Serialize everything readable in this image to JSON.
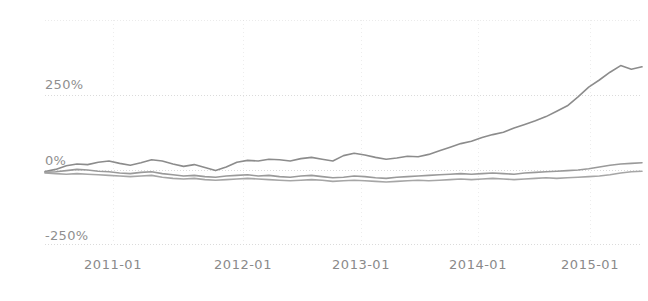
{
  "chart_data": {
    "type": "line",
    "title": "",
    "xlabel": "",
    "ylabel": "",
    "grid": true,
    "legend_position": "none",
    "ylim": [
      -250,
      400
    ],
    "yticks": [
      250,
      0,
      -250
    ],
    "ytick_labels": [
      "250%",
      "0%",
      "-250%"
    ],
    "x": [
      "2010-09",
      "2010-10",
      "2010-11",
      "2010-12",
      "2011-01",
      "2011-02",
      "2011-03",
      "2011-04",
      "2011-05",
      "2011-06",
      "2011-07",
      "2011-08",
      "2011-09",
      "2011-10",
      "2011-11",
      "2011-12",
      "2012-01",
      "2012-02",
      "2012-03",
      "2012-04",
      "2012-05",
      "2012-06",
      "2012-07",
      "2012-08",
      "2012-09",
      "2012-10",
      "2012-11",
      "2012-12",
      "2013-01",
      "2013-02",
      "2013-03",
      "2013-04",
      "2013-05",
      "2013-06",
      "2013-07",
      "2013-08",
      "2013-09",
      "2013-10",
      "2013-11",
      "2013-12",
      "2014-01",
      "2014-02",
      "2014-03",
      "2014-04",
      "2014-05",
      "2014-06",
      "2014-07",
      "2014-08",
      "2014-09",
      "2014-10",
      "2014-11",
      "2014-12",
      "2015-01",
      "2015-02",
      "2015-03",
      "2015-04",
      "2015-05"
    ],
    "xticks": [
      "2011-01",
      "2012-01",
      "2013-01",
      "2014-01",
      "2015-01"
    ],
    "xtick_positions_px": [
      113,
      243,
      361,
      478,
      590
    ],
    "series": [
      {
        "name": "series-1",
        "color": "#8c8c8c",
        "values": [
          -5,
          2,
          14,
          20,
          18,
          26,
          30,
          22,
          16,
          24,
          34,
          30,
          20,
          12,
          18,
          8,
          -2,
          10,
          26,
          32,
          30,
          36,
          34,
          30,
          38,
          42,
          36,
          30,
          48,
          56,
          50,
          42,
          36,
          40,
          46,
          44,
          52,
          64,
          76,
          88,
          96,
          108,
          118,
          126,
          140,
          152,
          164,
          178,
          196,
          214,
          244,
          276,
          300,
          326,
          348,
          336,
          344
        ]
      },
      {
        "name": "series-2",
        "color": "#9a9a9a",
        "values": [
          -8,
          -6,
          -2,
          2,
          0,
          -4,
          -6,
          -10,
          -12,
          -8,
          -6,
          -12,
          -16,
          -20,
          -18,
          -22,
          -24,
          -20,
          -18,
          -16,
          -20,
          -18,
          -22,
          -24,
          -20,
          -18,
          -22,
          -26,
          -24,
          -20,
          -22,
          -26,
          -28,
          -24,
          -22,
          -20,
          -18,
          -16,
          -14,
          -12,
          -14,
          -12,
          -10,
          -12,
          -14,
          -10,
          -8,
          -6,
          -4,
          -2,
          0,
          4,
          10,
          16,
          20,
          22,
          24
        ]
      },
      {
        "name": "series-3",
        "color": "#a6a6a6",
        "values": [
          -10,
          -12,
          -14,
          -12,
          -14,
          -16,
          -18,
          -20,
          -22,
          -20,
          -18,
          -24,
          -28,
          -30,
          -28,
          -32,
          -34,
          -32,
          -30,
          -28,
          -30,
          -32,
          -34,
          -36,
          -34,
          -32,
          -34,
          -38,
          -36,
          -34,
          -36,
          -38,
          -40,
          -38,
          -36,
          -34,
          -36,
          -34,
          -32,
          -30,
          -32,
          -30,
          -28,
          -30,
          -32,
          -30,
          -28,
          -26,
          -28,
          -26,
          -24,
          -22,
          -20,
          -16,
          -10,
          -6,
          -4
        ]
      }
    ]
  },
  "axis": {
    "ytick_250": "250%",
    "ytick_0": "0%",
    "ytick_neg250": "-250%",
    "xtick_0": "2011-01",
    "xtick_1": "2012-01",
    "xtick_2": "2013-01",
    "xtick_3": "2014-01",
    "xtick_4": "2015-01"
  },
  "colors": {
    "gridline": "#d8d8d8",
    "axis_text": "#8a8a8a",
    "line_primary": "#8c8c8c",
    "line_secondary": "#9a9a9a",
    "line_tertiary": "#a6a6a6",
    "background": "#ffffff"
  }
}
